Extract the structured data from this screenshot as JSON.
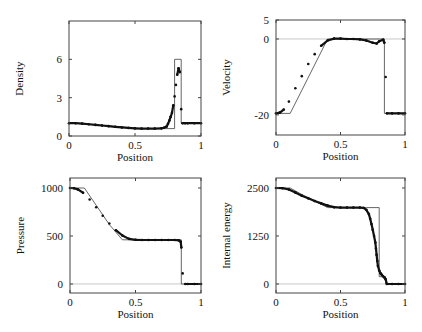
{
  "chart_data": [
    {
      "type": "line",
      "id": "density",
      "title": "",
      "xlabel": "Position",
      "ylabel": "Density",
      "xlim": [
        0,
        1
      ],
      "ylim": [
        0,
        9
      ],
      "xticks": [
        0,
        0.5,
        1
      ],
      "xtick_labels": [
        "0",
        "0.5",
        "1"
      ],
      "yticks": [
        0,
        3,
        6
      ],
      "ytick_labels": [
        "0",
        "3",
        "6"
      ],
      "zero_line": false,
      "frame": {
        "x0": 69,
        "x1": 201,
        "y0": 21,
        "y1": 136
      },
      "series": [
        {
          "name": "exact",
          "style": "thin-line",
          "x": [
            0,
            0.1,
            0.2,
            0.3,
            0.4,
            0.5,
            0.6,
            0.7,
            0.78,
            0.8,
            0.8,
            0.85,
            0.85,
            1.0
          ],
          "y": [
            1.0,
            0.96,
            0.88,
            0.78,
            0.7,
            0.58,
            0.58,
            0.58,
            0.58,
            0.58,
            6.0,
            6.0,
            1.0,
            1.0
          ]
        },
        {
          "name": "numerical",
          "style": "dots",
          "x": [
            0,
            0.05,
            0.1,
            0.15,
            0.2,
            0.25,
            0.3,
            0.35,
            0.4,
            0.45,
            0.5,
            0.55,
            0.6,
            0.65,
            0.7,
            0.72,
            0.74,
            0.75,
            0.76,
            0.77,
            0.78,
            0.79,
            0.8,
            0.81,
            0.82,
            0.83,
            0.84,
            0.85,
            0.86,
            0.88,
            0.9,
            0.95,
            1.0
          ],
          "y": [
            1.0,
            1.0,
            0.97,
            0.92,
            0.87,
            0.82,
            0.77,
            0.72,
            0.67,
            0.63,
            0.6,
            0.58,
            0.58,
            0.58,
            0.6,
            0.65,
            0.75,
            0.95,
            1.2,
            1.5,
            1.8,
            2.4,
            3.1,
            4.0,
            4.8,
            5.3,
            5.0,
            2.1,
            1.0,
            1.0,
            1.0,
            1.0,
            1.0
          ]
        }
      ]
    },
    {
      "type": "line",
      "id": "velocity",
      "title": "",
      "xlabel": "Position",
      "ylabel": "Velocity",
      "xlim": [
        0,
        1
      ],
      "ylim": [
        -25.3,
        5
      ],
      "xticks": [
        0,
        0.5,
        1
      ],
      "xtick_labels": [
        "0",
        "0.5",
        "1"
      ],
      "yticks": [
        -20,
        0,
        5
      ],
      "ytick_labels": [
        "-20",
        "0",
        "5"
      ],
      "zero_line": true,
      "frame": {
        "x0": 276,
        "x1": 405,
        "y0": 20,
        "y1": 135
      },
      "series": [
        {
          "name": "exact",
          "style": "thin-line",
          "x": [
            0,
            0.11,
            0.4,
            0.84,
            0.84,
            1.0
          ],
          "y": [
            -19.6,
            -19.6,
            0,
            0,
            -19.6,
            -19.6
          ]
        },
        {
          "name": "numerical",
          "style": "dots",
          "x": [
            0,
            0.03,
            0.06,
            0.1,
            0.15,
            0.2,
            0.25,
            0.3,
            0.35,
            0.4,
            0.45,
            0.5,
            0.55,
            0.6,
            0.65,
            0.7,
            0.75,
            0.78,
            0.8,
            0.83,
            0.84,
            0.85,
            0.86,
            0.9,
            0.95,
            1.0
          ],
          "y": [
            -19.6,
            -19.4,
            -18.6,
            -16.5,
            -13.0,
            -9.8,
            -6.6,
            -4.0,
            -1.8,
            -0.4,
            0.1,
            0.1,
            0.0,
            0.0,
            -0.1,
            -0.4,
            -1.0,
            -1.2,
            -0.6,
            -0.2,
            -1.0,
            -10.0,
            -19.6,
            -19.6,
            -19.6,
            -19.6
          ]
        }
      ]
    },
    {
      "type": "line",
      "id": "pressure",
      "title": "",
      "xlabel": "Position",
      "ylabel": "Pressure",
      "xlim": [
        0,
        1
      ],
      "ylim": [
        -94,
        1104
      ],
      "xticks": [
        0,
        0.5,
        1
      ],
      "xtick_labels": [
        "0",
        "0.5",
        "1"
      ],
      "yticks": [
        0,
        500,
        1000
      ],
      "ytick_labels": [
        "0",
        "500",
        "1000"
      ],
      "zero_line": true,
      "frame": {
        "x0": 70,
        "x1": 201,
        "y0": 178,
        "y1": 293
      },
      "series": [
        {
          "name": "exact",
          "style": "thin-line",
          "x": [
            0,
            0.11,
            0.2,
            0.3,
            0.4,
            0.5,
            0.6,
            0.7,
            0.85,
            0.85,
            1.0
          ],
          "y": [
            1000,
            1000,
            820,
            620,
            460,
            460,
            460,
            460,
            460,
            0.01,
            0.01
          ]
        },
        {
          "name": "numerical",
          "style": "dots",
          "x": [
            0,
            0.03,
            0.06,
            0.1,
            0.15,
            0.2,
            0.25,
            0.3,
            0.35,
            0.4,
            0.45,
            0.5,
            0.55,
            0.6,
            0.65,
            0.7,
            0.75,
            0.8,
            0.83,
            0.845,
            0.85,
            0.86,
            0.88,
            0.9,
            0.95,
            1.0
          ],
          "y": [
            1000,
            998,
            985,
            950,
            880,
            800,
            710,
            630,
            560,
            505,
            470,
            460,
            458,
            458,
            458,
            458,
            458,
            458,
            455,
            440,
            380,
            110,
            0,
            0,
            0,
            0
          ]
        }
      ]
    },
    {
      "type": "line",
      "id": "internal-energy",
      "title": "",
      "xlabel": "Position",
      "ylabel": "Internal energy",
      "xlim": [
        0,
        1
      ],
      "ylim": [
        -235,
        2760
      ],
      "xticks": [
        0,
        0.5,
        1
      ],
      "xtick_labels": [
        "0",
        "0.5",
        "1"
      ],
      "yticks": [
        0,
        1250,
        2500
      ],
      "ytick_labels": [
        "0",
        "1250",
        "2500"
      ],
      "zero_line": true,
      "frame": {
        "x0": 276,
        "x1": 405,
        "y0": 178,
        "y1": 293
      },
      "series": [
        {
          "name": "exact",
          "style": "thin-line",
          "x": [
            0,
            0.11,
            0.2,
            0.3,
            0.4,
            0.5,
            0.6,
            0.7,
            0.8,
            0.8,
            0.85,
            0.85,
            1.0
          ],
          "y": [
            2500,
            2500,
            2330,
            2160,
            1990,
            1990,
            1990,
            1990,
            1990,
            190,
            190,
            0.01,
            0.01
          ]
        },
        {
          "name": "numerical",
          "style": "dots",
          "x": [
            0,
            0.05,
            0.1,
            0.15,
            0.2,
            0.25,
            0.3,
            0.35,
            0.4,
            0.45,
            0.5,
            0.55,
            0.6,
            0.65,
            0.68,
            0.7,
            0.72,
            0.73,
            0.74,
            0.75,
            0.76,
            0.77,
            0.775,
            0.78,
            0.785,
            0.79,
            0.8,
            0.81,
            0.82,
            0.83,
            0.84,
            0.85,
            0.86,
            0.9,
            0.95,
            1.0
          ],
          "y": [
            2500,
            2495,
            2460,
            2380,
            2300,
            2230,
            2160,
            2100,
            2040,
            2000,
            1990,
            1990,
            1990,
            1990,
            1980,
            1930,
            1820,
            1700,
            1560,
            1410,
            1250,
            1080,
            920,
            760,
            600,
            470,
            350,
            280,
            240,
            200,
            170,
            120,
            0,
            0,
            0,
            0
          ]
        }
      ]
    }
  ]
}
